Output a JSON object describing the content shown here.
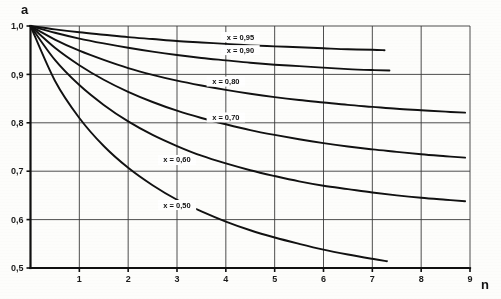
{
  "figure": {
    "background_color": "#fdfdfb",
    "ink_color": "#111111",
    "grid_color": "#3a3a3a"
  },
  "chart_data": {
    "type": "line",
    "title": "",
    "subtitle": "",
    "xlabel": "n",
    "ylabel": "a",
    "xlim": [
      0,
      9
    ],
    "ylim": [
      0.5,
      1.0
    ],
    "xticks": [
      1,
      2,
      3,
      4,
      5,
      6,
      7,
      8,
      9
    ],
    "xtick_labels": [
      "1",
      "2",
      "3",
      "4",
      "5",
      "6",
      "7",
      "8",
      "9"
    ],
    "yticks": [
      0.5,
      0.6,
      0.7,
      0.8,
      0.9,
      1.0
    ],
    "ytick_labels": [
      "0,5",
      "0,6",
      "0,7",
      "0,8",
      "0,9",
      "1,0"
    ],
    "grid": true,
    "legend_position": "inline-curve-labels",
    "decimal_separator": ",",
    "x": [
      0,
      0.5,
      1,
      1.5,
      2,
      2.5,
      3,
      3.5,
      4,
      4.5,
      5,
      5.5,
      6,
      6.5,
      7,
      7.5,
      8,
      8.5,
      9
    ],
    "series": [
      {
        "name": "x = 0,95",
        "label": "x = 0,95",
        "parameter": 0.95,
        "label_x": 4.3,
        "label_y": 0.972,
        "x": [
          0,
          0.5,
          1,
          1.5,
          2,
          2.5,
          3,
          3.5,
          4,
          4.5,
          5,
          5.5,
          6,
          6.5,
          7,
          7.25
        ],
        "values": [
          1.0,
          0.993,
          0.987,
          0.982,
          0.977,
          0.973,
          0.969,
          0.966,
          0.963,
          0.96,
          0.958,
          0.956,
          0.954,
          0.952,
          0.951,
          0.95
        ]
      },
      {
        "name": "x = 0,90",
        "label": "x = 0,90",
        "parameter": 0.9,
        "label_x": 4.3,
        "label_y": 0.945,
        "x": [
          0,
          0.5,
          1,
          1.5,
          2,
          2.5,
          3,
          3.5,
          4,
          4.5,
          5,
          5.5,
          6,
          6.5,
          7,
          7.35
        ],
        "values": [
          1.0,
          0.986,
          0.974,
          0.964,
          0.955,
          0.947,
          0.94,
          0.934,
          0.929,
          0.924,
          0.92,
          0.917,
          0.914,
          0.911,
          0.909,
          0.908
        ]
      },
      {
        "name": "x = 0,80",
        "label": "x = 0,80",
        "parameter": 0.8,
        "label_x": 4.0,
        "label_y": 0.88,
        "x": [
          0,
          0.5,
          1,
          1.5,
          2,
          2.5,
          3,
          3.5,
          4,
          4.5,
          5,
          5.5,
          6,
          6.5,
          7,
          7.5,
          8,
          8.5,
          8.9
        ],
        "values": [
          1.0,
          0.972,
          0.949,
          0.93,
          0.913,
          0.899,
          0.887,
          0.877,
          0.868,
          0.86,
          0.853,
          0.847,
          0.842,
          0.837,
          0.833,
          0.829,
          0.826,
          0.823,
          0.821
        ]
      },
      {
        "name": "x = 0,70",
        "label": "x = 0,70",
        "parameter": 0.7,
        "label_x": 4.0,
        "label_y": 0.806,
        "x": [
          0,
          0.5,
          1,
          1.5,
          2,
          2.5,
          3,
          3.5,
          4,
          4.5,
          5,
          5.5,
          6,
          6.5,
          7,
          7.5,
          8,
          8.5,
          8.9
        ],
        "values": [
          1.0,
          0.955,
          0.919,
          0.889,
          0.864,
          0.843,
          0.825,
          0.81,
          0.797,
          0.785,
          0.775,
          0.766,
          0.758,
          0.751,
          0.745,
          0.74,
          0.735,
          0.731,
          0.728
        ]
      },
      {
        "name": "x = 0,60",
        "label": "x = 0,60",
        "parameter": 0.6,
        "label_x": 3.0,
        "label_y": 0.718,
        "x": [
          0,
          0.5,
          1,
          1.5,
          2,
          2.5,
          3,
          3.5,
          4,
          4.5,
          5,
          5.5,
          6,
          6.5,
          7,
          7.5,
          8,
          8.5,
          8.9
        ],
        "values": [
          1.0,
          0.93,
          0.878,
          0.837,
          0.803,
          0.775,
          0.752,
          0.732,
          0.716,
          0.702,
          0.69,
          0.679,
          0.67,
          0.663,
          0.656,
          0.65,
          0.645,
          0.641,
          0.638
        ]
      },
      {
        "name": "x = 0,50",
        "label": "x = 0,50",
        "parameter": 0.5,
        "label_x": 3.0,
        "label_y": 0.625,
        "x": [
          0,
          0.5,
          1,
          1.5,
          2,
          2.5,
          3,
          3.5,
          4,
          4.5,
          5,
          5.5,
          6,
          6.5,
          7,
          7.3
        ],
        "values": [
          1.0,
          0.887,
          0.81,
          0.752,
          0.707,
          0.671,
          0.641,
          0.617,
          0.596,
          0.578,
          0.563,
          0.55,
          0.538,
          0.528,
          0.519,
          0.514
        ]
      }
    ]
  }
}
